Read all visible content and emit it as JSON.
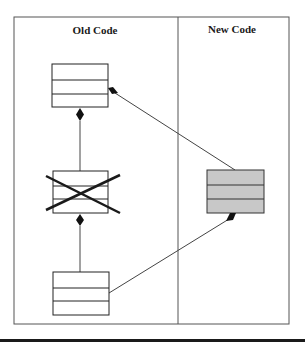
{
  "diagram": {
    "panels": [
      {
        "id": "old-code",
        "label": "Old Code"
      },
      {
        "id": "new-code",
        "label": "New Code"
      }
    ],
    "classes": [
      {
        "id": "top-old-class",
        "panel": "old-code",
        "compartments": 3,
        "fill": "#ffffff",
        "crossed_out": false
      },
      {
        "id": "middle-old-class",
        "panel": "old-code",
        "compartments": 3,
        "fill": "#ffffff",
        "crossed_out": true
      },
      {
        "id": "bottom-old-class",
        "panel": "old-code",
        "compartments": 3,
        "fill": "#ffffff",
        "crossed_out": false
      },
      {
        "id": "new-class",
        "panel": "new-code",
        "compartments": 3,
        "fill": "#c8c8c8",
        "crossed_out": false
      }
    ],
    "relationships": [
      {
        "from": "top-old-class",
        "to": "middle-old-class",
        "type": "composition",
        "diamond_at": "top-old-class"
      },
      {
        "from": "middle-old-class",
        "to": "bottom-old-class",
        "type": "composition",
        "diamond_at": "middle-old-class"
      },
      {
        "from": "top-old-class",
        "to": "new-class",
        "type": "composition",
        "diamond_at": "top-old-class"
      },
      {
        "from": "new-class",
        "to": "bottom-old-class",
        "type": "composition",
        "diamond_at": "new-class"
      }
    ],
    "colors": {
      "line": "#1a1a1a",
      "frame": "#555555",
      "new_class_fill": "#c8c8c8",
      "cross": "#1a1a1a"
    }
  }
}
